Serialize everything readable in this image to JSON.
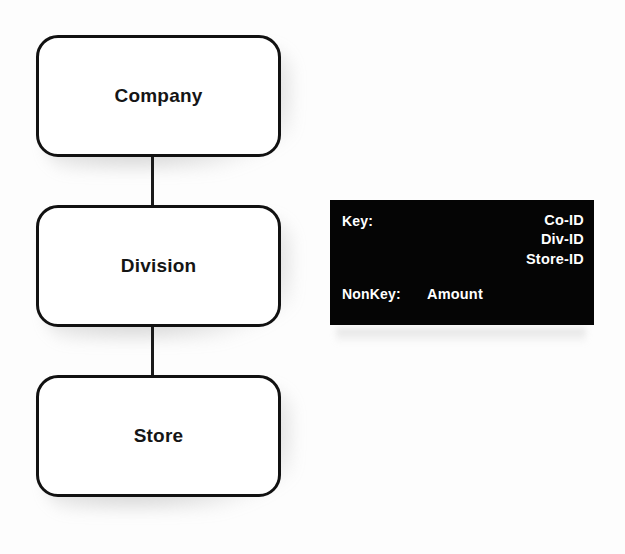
{
  "diagram": {
    "entities": [
      {
        "id": "company",
        "label": "Company"
      },
      {
        "id": "division",
        "label": "Division"
      },
      {
        "id": "store",
        "label": "Store"
      }
    ],
    "connectors": [
      {
        "from": "Company",
        "to": "Division"
      },
      {
        "from": "Division",
        "to": "Store"
      }
    ]
  },
  "key_box": {
    "key_caption": "Key:",
    "key_attributes": [
      "Co-ID",
      "Div-ID",
      "Store-ID"
    ],
    "nonkey_caption": "NonKey:",
    "nonkey_value": "Amount",
    "background_color": "#050505",
    "text_color": "#ffffff"
  },
  "colors": {
    "page_background": "#fdfdfd",
    "entity_fill": "#ffffff",
    "entity_border": "#111111",
    "connector": "#1a1a1a"
  }
}
